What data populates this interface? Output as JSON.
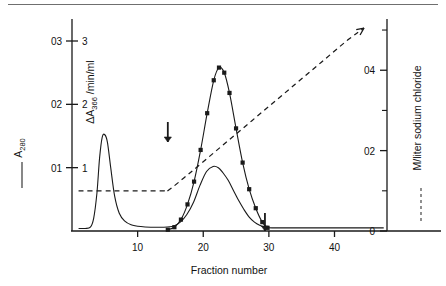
{
  "figure": {
    "kind": "chromatography-elution-profile",
    "top_rule": true
  },
  "axes": {
    "x": {
      "label": "Fraction number",
      "ticks": [
        "10",
        "20",
        "30",
        "40"
      ],
      "tick_values": [
        10,
        20,
        30,
        40
      ],
      "range": [
        0,
        48
      ]
    },
    "y_left_outer": {
      "label": "A",
      "label_sub": "280",
      "legend_marker": "solid-line",
      "ticks": [
        "0.1",
        "0.2",
        "0.3"
      ],
      "ticks_raw": [
        "01",
        "02",
        "03"
      ],
      "tick_values": [
        0.1,
        0.2,
        0.3
      ],
      "range": [
        0,
        0.33
      ]
    },
    "y_left_inner": {
      "label": "ΔA",
      "label_sub": "366",
      "label_tail": "/min/ml",
      "ticks": [
        "1",
        "2",
        "3"
      ],
      "tick_values": [
        1,
        2,
        3
      ],
      "range": [
        0,
        3.3
      ]
    },
    "y_right": {
      "label": "M/liter sodium chloride",
      "legend_marker": "dashed-line",
      "ticks": [
        "0",
        "02",
        "04"
      ],
      "ticks_display": [
        "0",
        "0.2",
        "0.4"
      ],
      "tick_values": [
        0,
        0.2,
        0.4
      ],
      "minor_tick_values": [
        0.1,
        0.3,
        0.5
      ],
      "range": [
        0,
        0.52
      ]
    }
  },
  "annotations": {
    "arrow": {
      "name": "gradient-start-arrow",
      "fraction": 14.6,
      "direction": "down"
    },
    "pool_arrow": {
      "name": "pool-end-arrow",
      "fraction": 29.4,
      "direction": "down"
    }
  },
  "chart_data": {
    "type": "line",
    "title": "",
    "xlabel": "Fraction number",
    "ylabel": "A280 / ΔA366 per min per ml",
    "y2label": "M/liter sodium chloride",
    "xlim": [
      0,
      48
    ],
    "ylim_left_A280": [
      0,
      0.33
    ],
    "ylim_left_activity": [
      0,
      3.3
    ],
    "ylim_right": [
      0,
      0.52
    ],
    "grid": false,
    "legend_position": "outside-left-and-right",
    "series": [
      {
        "name": "A280",
        "style": "solid",
        "marker": "none",
        "axis": "left_outer",
        "x": [
          1.0,
          2.0,
          2.8,
          3.3,
          3.8,
          4.2,
          4.6,
          5.0,
          5.4,
          5.9,
          6.5,
          7.2,
          8.0,
          9.0,
          10.5,
          12.0,
          14.0,
          15.5,
          16.5,
          17.5,
          18.5,
          19.5,
          20.5,
          21.5,
          22.3,
          23.0,
          23.8,
          24.6,
          25.4,
          26.2,
          27.0,
          27.8,
          28.6,
          29.4,
          30.5,
          32.0,
          35.0,
          40.0,
          45.0,
          47.5
        ],
        "y": [
          0.004,
          0.004,
          0.006,
          0.02,
          0.06,
          0.115,
          0.148,
          0.152,
          0.14,
          0.1,
          0.055,
          0.028,
          0.016,
          0.01,
          0.007,
          0.006,
          0.006,
          0.008,
          0.014,
          0.026,
          0.045,
          0.072,
          0.094,
          0.102,
          0.1,
          0.092,
          0.08,
          0.064,
          0.048,
          0.034,
          0.022,
          0.014,
          0.009,
          0.006,
          0.005,
          0.005,
          0.005,
          0.005,
          0.005,
          0.005
        ]
      },
      {
        "name": "ΔA366/min/ml enzyme activity",
        "style": "solid-with-markers",
        "marker": "square",
        "axis": "left_inner",
        "x": [
          14.6,
          15.6,
          16.6,
          17.6,
          18.6,
          19.6,
          20.6,
          21.6,
          22.4,
          23.2,
          24.0,
          25.0,
          26.0,
          27.0,
          28.0,
          29.0,
          29.8
        ],
        "y": [
          0.02,
          0.06,
          0.18,
          0.42,
          0.78,
          1.28,
          1.86,
          2.38,
          2.58,
          2.5,
          2.18,
          1.62,
          1.08,
          0.66,
          0.36,
          0.14,
          0.05
        ]
      },
      {
        "name": "NaCl gradient",
        "style": "dashed",
        "marker": "none",
        "axis": "right",
        "x": [
          1.0,
          6.0,
          11.0,
          14.0,
          14.6,
          18.0,
          22.0,
          26.0,
          30.0,
          34.0,
          38.0,
          42.0,
          44.5
        ],
        "y": [
          0.1,
          0.1,
          0.1,
          0.1,
          0.1,
          0.145,
          0.2,
          0.255,
          0.31,
          0.365,
          0.42,
          0.475,
          0.505
        ]
      }
    ],
    "annotations": [
      {
        "text": "arrow down at fraction 14.6",
        "type": "arrow"
      },
      {
        "text": "arrow down at fraction 29.4",
        "type": "arrow"
      }
    ]
  }
}
